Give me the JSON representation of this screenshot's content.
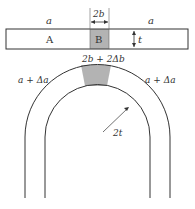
{
  "labels": {
    "a_left": "a",
    "a_right": "a",
    "width_B": "2b",
    "region_A": "A",
    "region_B": "B",
    "thickness": "t",
    "bent_width": "2b + 2Δb",
    "a_delta_left": "a + Δa",
    "a_delta_right": "a + Δa",
    "radius": "2t"
  },
  "colors": {
    "stroke": "#333333",
    "fill_B": "#b3b3b3"
  }
}
